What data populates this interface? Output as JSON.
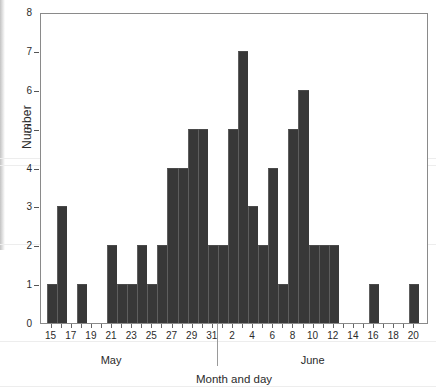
{
  "chart_data": {
    "type": "bar",
    "title": "",
    "xlabel": "Month and day",
    "ylabel": "Number",
    "ylim": [
      0,
      8
    ],
    "ytick_labels": [
      "0",
      "1",
      "2",
      "3",
      "4",
      "5",
      "6",
      "7",
      "8"
    ],
    "yticks": [
      0,
      1,
      2,
      3,
      4,
      5,
      6,
      7,
      8
    ],
    "grid": false,
    "legend": null,
    "xtick_labels": [
      "15",
      "17",
      "19",
      "21",
      "23",
      "25",
      "27",
      "29",
      "31",
      "2",
      "4",
      "6",
      "8",
      "10",
      "12",
      "14",
      "16",
      "18",
      "20"
    ],
    "group_labels": [
      "May",
      "June"
    ],
    "categories": [
      "May 15",
      "May 16",
      "May 17",
      "May 18",
      "May 19",
      "May 20",
      "May 21",
      "May 22",
      "May 23",
      "May 24",
      "May 25",
      "May 26",
      "May 27",
      "May 28",
      "May 29",
      "May 30",
      "May 31",
      "June 1",
      "June 2",
      "June 3",
      "June 4",
      "June 5",
      "June 6",
      "June 7",
      "June 8",
      "June 9",
      "June 10",
      "June 11",
      "June 12",
      "June 13",
      "June 14",
      "June 15",
      "June 16",
      "June 17",
      "June 18",
      "June 19",
      "June 20"
    ],
    "values": [
      1,
      3,
      0,
      1,
      0,
      0,
      2,
      1,
      1,
      2,
      1,
      2,
      4,
      4,
      5,
      5,
      2,
      2,
      5,
      7,
      3,
      2,
      4,
      1,
      5,
      6,
      2,
      2,
      2,
      0,
      0,
      0,
      1,
      0,
      0,
      0,
      1
    ],
    "bar_color": "#383838",
    "frame_color": "#8a8a8a",
    "background": "#ffffff"
  }
}
